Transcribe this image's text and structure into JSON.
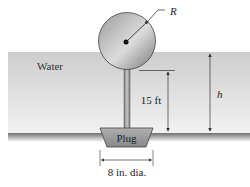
{
  "figure": {
    "labels": {
      "water": "Water",
      "radius": "R",
      "rod_height": "15 ft",
      "depth": "h",
      "plug": "Plug",
      "plug_diameter": "8 in. dia."
    },
    "colors": {
      "background": "#ffffff",
      "water_top": "#cfcfcf",
      "water_bottom": "#f0f0f0",
      "ground": "#8a8a8a",
      "sphere_light": "#e2e2e2",
      "sphere_dark": "#6e6e6e",
      "plug": "#9c9c9c",
      "line": "#333333"
    }
  }
}
